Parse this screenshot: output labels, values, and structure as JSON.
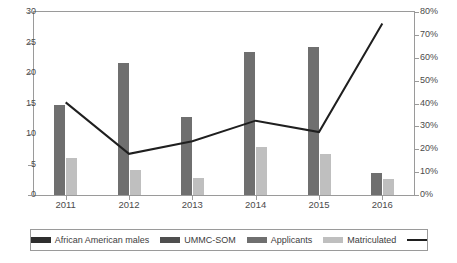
{
  "chart_data": {
    "type": "bar",
    "title": "",
    "subtitle": "",
    "xlabel": "",
    "ylabel": "",
    "categories": [
      "2011",
      "2012",
      "2013",
      "2014",
      "2015",
      "2016"
    ],
    "series": [
      {
        "name": "Applicants",
        "type": "bar",
        "axis": "left",
        "color": "#6f6f6f",
        "values": [
          14.8,
          21.7,
          12.8,
          23.4,
          24.3,
          3.6
        ]
      },
      {
        "name": "Matriculated",
        "type": "bar",
        "axis": "left",
        "color": "#bfbfbf",
        "values": [
          6.0,
          4.1,
          2.8,
          7.8,
          6.7,
          2.7
        ]
      },
      {
        "name": "percent-line",
        "type": "line",
        "axis": "right",
        "color": "#1f1f1f",
        "values": [
          40.5,
          18.0,
          23.5,
          32.5,
          27.5,
          75.0
        ]
      }
    ],
    "left_axis": {
      "min": 0,
      "max": 30,
      "step": 5,
      "ticks": [
        "0",
        "5",
        "10",
        "15",
        "20",
        "25",
        "30"
      ]
    },
    "right_axis": {
      "min": 0,
      "max": 80,
      "step": 10,
      "ticks": [
        "0%",
        "10%",
        "20%",
        "30%",
        "40%",
        "50%",
        "60%",
        "70%",
        "80%"
      ]
    },
    "grid": false,
    "legend_position": "bottom",
    "legend": [
      {
        "label": "African American males",
        "swatch": "#2e2e2e",
        "kind": "bar"
      },
      {
        "label": "UMMC-SOM",
        "swatch": "#4f4f4f",
        "kind": "bar"
      },
      {
        "label": "Applicants",
        "swatch": "#6f6f6f",
        "kind": "bar"
      },
      {
        "label": "Matriculated",
        "swatch": "#bfbfbf",
        "kind": "bar"
      },
      {
        "label": "",
        "swatch": "#1f1f1f",
        "kind": "line"
      }
    ],
    "colors": {
      "applicants": "#6f6f6f",
      "matriculated": "#bfbfbf",
      "line": "#1f1f1f",
      "frame": "#9a9a9a",
      "tick_text": "#4b4b4b",
      "background": "#ffffff"
    }
  }
}
